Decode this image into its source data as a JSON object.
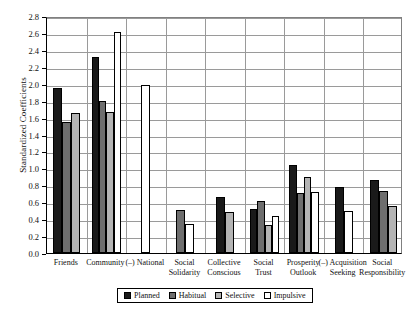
{
  "chart_data": {
    "type": "bar",
    "title": "",
    "xlabel": "",
    "ylabel": "Standardized Coefficients",
    "ylim": [
      0.0,
      2.8
    ],
    "ytick_step": 0.2,
    "grid": true,
    "legend_position": "bottom",
    "yticks": [
      "0.0",
      "0.2",
      "0.4",
      "0.6",
      "0.8",
      "1.0",
      "1.2",
      "1.4",
      "1.6",
      "1.8",
      "2.0",
      "2.2",
      "2.4",
      "2.6",
      "2.8"
    ],
    "categories": [
      "Friends",
      "Community",
      "(–) National",
      "Social\nSolidarity",
      "Collective\nConscious",
      "Social\nTrust",
      "Prosperity\nOutlook",
      "(–) Acquisition\nSeeking",
      "Social\nResponsibility"
    ],
    "series": [
      {
        "name": "Planned",
        "color": "#1a1a1a",
        "values": [
          1.95,
          2.32,
          null,
          null,
          0.66,
          0.52,
          1.04,
          0.78,
          0.86
        ]
      },
      {
        "name": "Habitual",
        "color": "#6e6e6e",
        "values": [
          1.55,
          1.8,
          null,
          0.51,
          null,
          0.62,
          0.71,
          null,
          0.73
        ]
      },
      {
        "name": "Selective",
        "color": "#b4b4b4",
        "values": [
          1.66,
          1.67,
          null,
          null,
          0.48,
          0.33,
          0.9,
          null,
          0.55
        ]
      },
      {
        "name": "Impulsive",
        "color": "#ffffff",
        "values": [
          null,
          2.61,
          1.99,
          0.34,
          null,
          0.44,
          0.72,
          0.5,
          null
        ]
      }
    ]
  },
  "legend": {
    "items": [
      {
        "label": "Planned",
        "color": "#1a1a1a"
      },
      {
        "label": "Habitual",
        "color": "#6e6e6e"
      },
      {
        "label": "Selective",
        "color": "#b4b4b4"
      },
      {
        "label": "Impulsive",
        "color": "#ffffff"
      }
    ]
  }
}
